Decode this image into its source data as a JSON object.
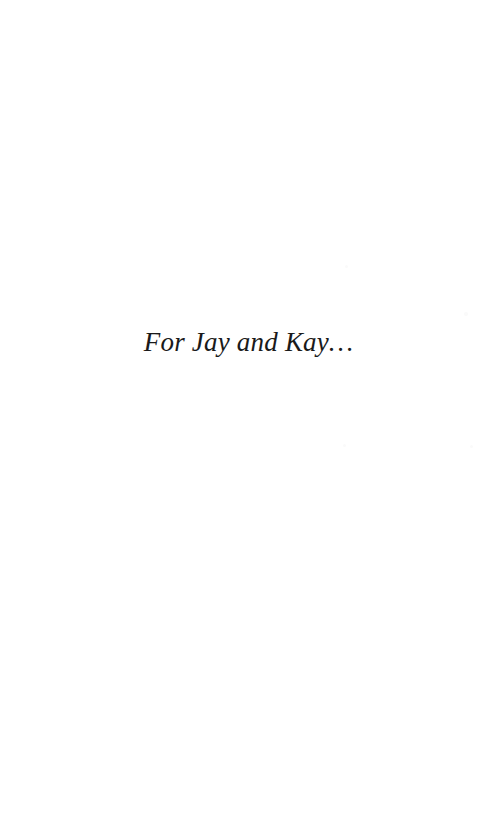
{
  "page": {
    "kind": "book-dedication-page",
    "background_color": "#ffffff",
    "width": 477,
    "height": 816
  },
  "dedication": {
    "text": "For Jay and Kay…",
    "color": "#1a1a1a",
    "style": "italic-serif",
    "font_size_px": 27,
    "alignment": "center",
    "baseline_y": 357
  },
  "artifacts": {
    "specks": [
      {
        "x": 345,
        "y": 265,
        "size": 3
      },
      {
        "x": 465,
        "y": 313,
        "size": 4
      },
      {
        "x": 343,
        "y": 444,
        "size": 3
      },
      {
        "x": 470,
        "y": 445,
        "size": 3
      }
    ]
  }
}
